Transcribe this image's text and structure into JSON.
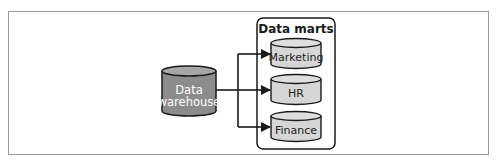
{
  "diagram": {
    "source": {
      "label_line1": "Data",
      "label_line2": "warehouse",
      "fill": "#8c8c8c",
      "text_color": "#ffffff"
    },
    "group": {
      "title": "Data marts"
    },
    "marts": [
      {
        "label": "Marketing"
      },
      {
        "label": "HR"
      },
      {
        "label": "Finance"
      }
    ],
    "colors": {
      "mart_fill": "#d6d6d6",
      "stroke": "#1a1a1a",
      "frame": "#9a9a9a"
    }
  }
}
